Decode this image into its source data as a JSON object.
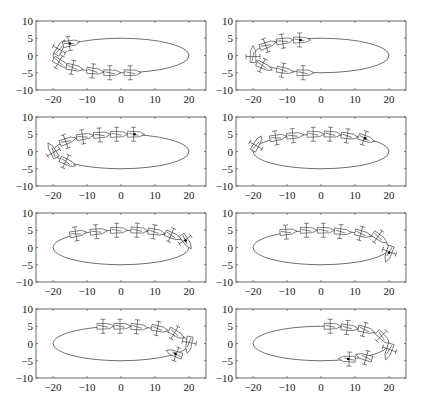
{
  "chart_data": {
    "type": "scatter",
    "layout": {
      "rows": 4,
      "cols": 2,
      "grid": false,
      "legend": "none"
    },
    "shared_axes": {
      "xlim": [
        -25,
        25
      ],
      "ylim": [
        -10,
        10
      ],
      "xticks": [
        -20,
        -10,
        0,
        10,
        20
      ],
      "xtick_labels": [
        "−20",
        "−10",
        "0",
        "10",
        "20"
      ],
      "yticks": [
        10,
        5,
        0,
        -5,
        -10
      ],
      "ytick_labels": [
        "10",
        "5",
        "0",
        "−5",
        "−10"
      ],
      "xlabel": "",
      "ylabel": ""
    },
    "reference_path": {
      "shape": "ellipse",
      "center": [
        0,
        0
      ],
      "semi_axis_x": 20,
      "semi_axis_y": 5
    },
    "panels": [
      {
        "id": "panel-1",
        "title": "",
        "current": [
          -15,
          3.5
        ],
        "vehicles": [
          [
            -18,
            2,
            60
          ],
          [
            -18,
            -2,
            -30
          ],
          [
            -14,
            -3.5,
            -12
          ],
          [
            -8,
            -4.5,
            -6
          ],
          [
            -3,
            -5,
            0
          ],
          [
            3,
            -5,
            0
          ],
          [
            -15,
            3.5,
            10
          ]
        ]
      },
      {
        "id": "panel-2",
        "title": "",
        "current": [
          -6,
          4.5
        ],
        "vehicles": [
          [
            -16,
            3,
            20
          ],
          [
            -11,
            4.2,
            8
          ],
          [
            -6,
            4.5,
            0
          ],
          [
            -20,
            0,
            90
          ],
          [
            -17,
            -3,
            -25
          ],
          [
            -11,
            -4.3,
            -10
          ],
          [
            -5,
            -5,
            0
          ]
        ]
      },
      {
        "id": "panel-3",
        "title": "",
        "current": [
          4,
          5
        ],
        "vehicles": [
          [
            -16,
            3,
            20
          ],
          [
            -11,
            4.3,
            8
          ],
          [
            -6,
            4.8,
            4
          ],
          [
            -1,
            5,
            0
          ],
          [
            4,
            5,
            0
          ],
          [
            -20,
            0,
            120
          ],
          [
            -16,
            -3,
            -25
          ]
        ]
      },
      {
        "id": "panel-4",
        "title": "",
        "current": [
          13,
          3.8
        ],
        "vehicles": [
          [
            -19,
            2,
            60
          ],
          [
            -13,
            4,
            10
          ],
          [
            -8,
            4.6,
            5
          ],
          [
            -2,
            5,
            0
          ],
          [
            3,
            5,
            -3
          ],
          [
            8,
            4.5,
            -8
          ],
          [
            13,
            3.8,
            -18
          ]
        ]
      },
      {
        "id": "panel-5",
        "title": "",
        "current": [
          19,
          2
        ],
        "vehicles": [
          [
            -13,
            4,
            10
          ],
          [
            -7,
            4.6,
            5
          ],
          [
            -1,
            5,
            0
          ],
          [
            5,
            5,
            -3
          ],
          [
            10,
            4.5,
            -8
          ],
          [
            15,
            3.5,
            -22
          ],
          [
            19,
            2,
            -55
          ]
        ]
      },
      {
        "id": "panel-6",
        "title": "",
        "current": [
          20,
          -1.5
        ],
        "vehicles": [
          [
            -10,
            4.5,
            5
          ],
          [
            -4,
            5,
            0
          ],
          [
            1,
            5,
            0
          ],
          [
            6,
            4.6,
            -6
          ],
          [
            12,
            4,
            -15
          ],
          [
            17,
            3,
            -35
          ],
          [
            20,
            -1.5,
            -110
          ]
        ]
      },
      {
        "id": "panel-7",
        "title": "",
        "current": [
          16,
          -3
        ],
        "vehicles": [
          [
            -5,
            5,
            0
          ],
          [
            0,
            5,
            0
          ],
          [
            5,
            4.8,
            -5
          ],
          [
            11,
            4.3,
            -12
          ],
          [
            16,
            3,
            -30
          ],
          [
            20,
            0,
            -100
          ],
          [
            16,
            -3,
            160
          ]
        ]
      },
      {
        "id": "panel-8",
        "title": "",
        "current": [
          8,
          -4.5
        ],
        "vehicles": [
          [
            3,
            5,
            0
          ],
          [
            8,
            4.6,
            -6
          ],
          [
            13,
            4,
            -15
          ],
          [
            18,
            2,
            -45
          ],
          [
            20,
            -2,
            -110
          ],
          [
            13,
            -4,
            165
          ],
          [
            8,
            -4.5,
            178
          ]
        ]
      }
    ]
  },
  "caption": {
    "text": ""
  }
}
